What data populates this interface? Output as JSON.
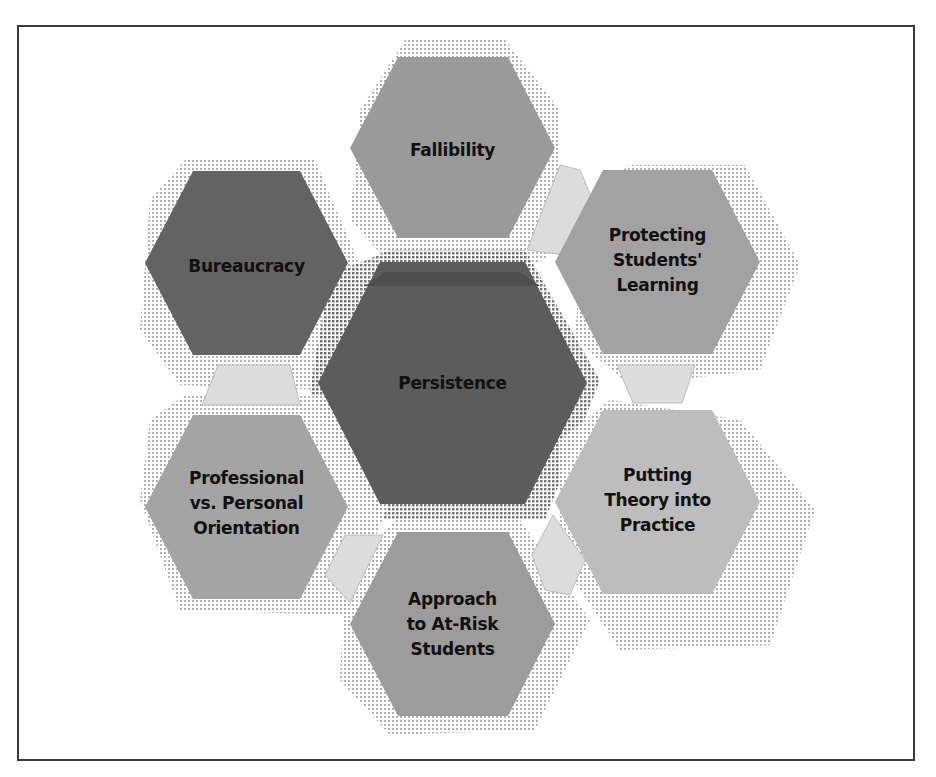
{
  "diagram": {
    "type": "hexagon-cluster",
    "center": {
      "label": "Persistence",
      "fill": "#5c5c5c"
    },
    "nodes": [
      {
        "id": "fallibility",
        "label": "Fallibility",
        "fill": "#9a9a9a"
      },
      {
        "id": "protecting",
        "label": "Protecting Students' Learning",
        "lines": [
          "Protecting",
          "Students'",
          "Learning"
        ],
        "fill": "#a2a2a2"
      },
      {
        "id": "putting",
        "label": "Putting Theory into Practice",
        "lines": [
          "Putting",
          "Theory into",
          "Practice"
        ],
        "fill": "#bdbdbd"
      },
      {
        "id": "approach",
        "label": "Approach to At-Risk Students",
        "lines": [
          "Approach",
          "to At-Risk",
          "Students"
        ],
        "fill": "#9c9c9c"
      },
      {
        "id": "professional",
        "label": "Professional vs. Personal Orientation",
        "lines": [
          "Professional",
          "vs. Personal",
          "Orientation"
        ],
        "fill": "#a4a4a4"
      },
      {
        "id": "bureaucracy",
        "label": "Bureaucracy",
        "fill": "#636363"
      }
    ],
    "connector_fill": "#dcdcdc",
    "shadow_fill": "#d4d4d4",
    "border_color": "#3a3a3a"
  },
  "labels": {
    "fallibility": "Fallibility",
    "bureaucracy": "Bureaucracy",
    "persistence": "Persistence",
    "protecting": [
      "Protecting",
      "Students'",
      "Learning"
    ],
    "putting": [
      "Putting",
      "Theory into",
      "Practice"
    ],
    "approach": [
      "Approach",
      "to At-Risk",
      "Students"
    ],
    "professional": [
      "Professional",
      "vs. Personal",
      "Orientation"
    ]
  }
}
